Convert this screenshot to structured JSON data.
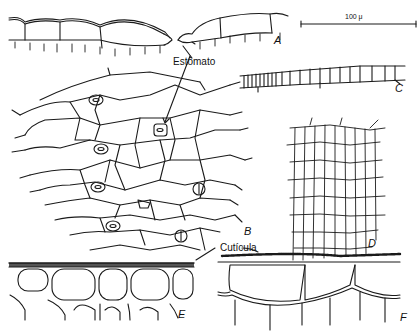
{
  "figure": {
    "labels": {
      "stomata": "Estômato",
      "cuticle": "Cutícula",
      "scale_bar": "100 μ"
    },
    "panels": [
      "A",
      "B",
      "C",
      "D",
      "E",
      "F"
    ],
    "colors": {
      "ink": "#1a1a1a",
      "background": "#ffffff"
    }
  }
}
